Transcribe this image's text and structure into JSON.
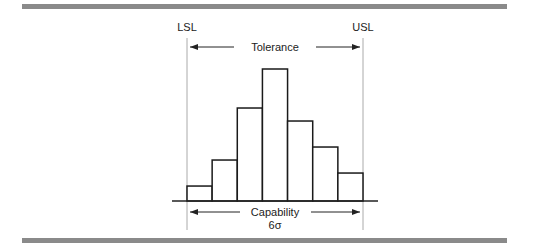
{
  "labels": {
    "lsl": "LSL",
    "usl": "USL",
    "tolerance": "Tolerance",
    "capability": "Capability",
    "sigma": "6σ"
  },
  "colors": {
    "frame_bar": "#8a8a8a",
    "bar_stroke": "#1a1a1a",
    "limit_line": "#aaaaaa"
  },
  "chart_data": {
    "type": "bar",
    "title": "",
    "xlabel": "",
    "ylabel": "",
    "categories": [
      "1",
      "2",
      "3",
      "4",
      "5",
      "6",
      "7"
    ],
    "values": [
      1.15,
      3.15,
      7.15,
      10.15,
      6.15,
      4.15,
      2.15
    ],
    "ylim": [
      0,
      11
    ],
    "grid": false,
    "legend": "none",
    "annotations": [
      "LSL",
      "USL",
      "Tolerance",
      "Capability",
      "6σ"
    ]
  }
}
